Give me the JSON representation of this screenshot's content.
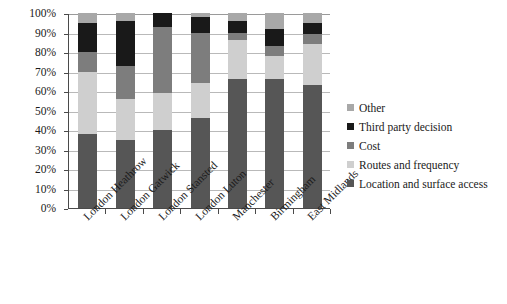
{
  "chart_data": {
    "type": "bar",
    "subtype": "stacked-percent",
    "title": "",
    "xlabel": "",
    "ylabel": "",
    "ylim": [
      0,
      100
    ],
    "y_tick_labels": [
      "0%",
      "10%",
      "20%",
      "30%",
      "40%",
      "50%",
      "60%",
      "70%",
      "80%",
      "90%",
      "100%"
    ],
    "y_ticks": [
      0,
      10,
      20,
      30,
      40,
      50,
      60,
      70,
      80,
      90,
      100
    ],
    "grid": true,
    "legend_position": "right",
    "categories": [
      "London Heathrow",
      "London Gatwick",
      "London Stansted",
      "London Luton",
      "Manchester",
      "Birmingham",
      "East Midlands"
    ],
    "series": [
      {
        "name": "Location and surface access",
        "color": "#565656",
        "values": [
          38,
          35,
          40,
          46,
          66,
          66,
          63
        ]
      },
      {
        "name": "Routes and frequency",
        "color": "#cfcfcf",
        "values": [
          32,
          21,
          19,
          18,
          20,
          12,
          21
        ]
      },
      {
        "name": "Cost",
        "color": "#7d7d7d",
        "values": [
          10,
          17,
          34,
          26,
          4,
          5,
          5
        ]
      },
      {
        "name": "Third party decision",
        "color": "#191919",
        "values": [
          15,
          23,
          7,
          8,
          6,
          9,
          6
        ]
      },
      {
        "name": "Other",
        "color": "#a8a8a8",
        "values": [
          5,
          4,
          0,
          2,
          4,
          8,
          5
        ]
      }
    ],
    "legend_entries": [
      {
        "label": "Other",
        "color": "#a8a8a8"
      },
      {
        "label": "Third party decision",
        "color": "#191919"
      },
      {
        "label": "Cost",
        "color": "#7d7d7d"
      },
      {
        "label": "Routes and frequency",
        "color": "#cfcfcf"
      },
      {
        "label": "Location and surface access",
        "color": "#565656"
      }
    ]
  }
}
